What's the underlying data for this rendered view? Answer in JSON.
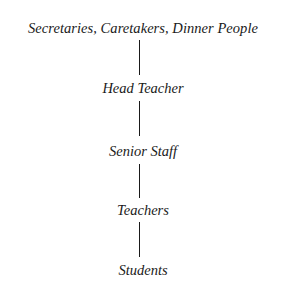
{
  "diagram": {
    "type": "hierarchy",
    "orientation": "vertical",
    "nodes": [
      {
        "label": "Secretaries, Caretakers, Dinner People"
      },
      {
        "label": "Head Teacher"
      },
      {
        "label": "Senior Staff"
      },
      {
        "label": "Teachers"
      },
      {
        "label": "Students"
      }
    ],
    "edges": [
      {
        "from": 0,
        "to": 1
      },
      {
        "from": 1,
        "to": 2
      },
      {
        "from": 2,
        "to": 3
      },
      {
        "from": 3,
        "to": 4
      }
    ],
    "colors": {
      "text": "#1a1a1a",
      "line": "#1a1a1a",
      "background": "#ffffff"
    }
  }
}
